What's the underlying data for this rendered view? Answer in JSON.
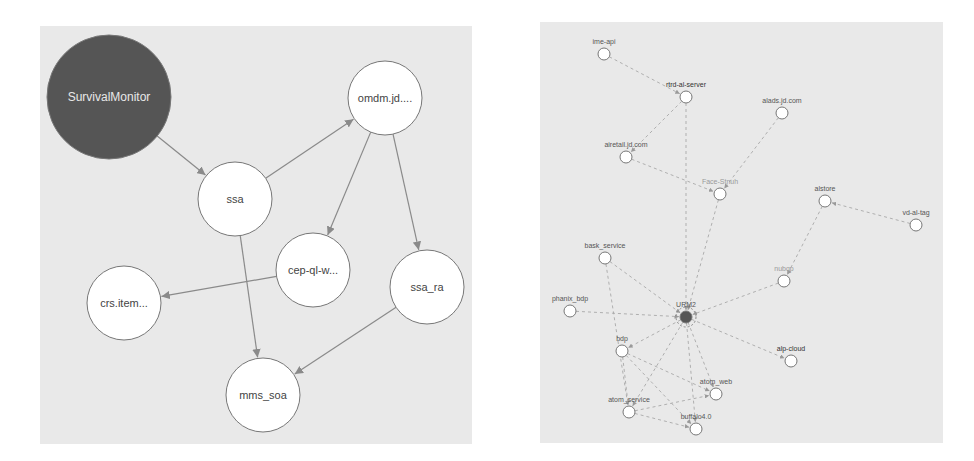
{
  "left_diagram": {
    "title": "",
    "background": "#e9e9e9",
    "edge_color": "#8a8a8a",
    "nodes": [
      {
        "id": "SurvivalMonitor",
        "label": "SurvivalMonitor",
        "x": 109,
        "y": 97,
        "r": 62,
        "fill": "#555555",
        "text_color": "#e8e8e8",
        "font_size": 12
      },
      {
        "id": "ssa",
        "label": "ssa",
        "x": 235,
        "y": 199,
        "r": 37,
        "fill": "#ffffff",
        "text_color": "#444444",
        "font_size": 11
      },
      {
        "id": "omdm",
        "label": "omdm.jd....",
        "x": 385,
        "y": 98,
        "r": 37,
        "fill": "#ffffff",
        "text_color": "#444444",
        "font_size": 11
      },
      {
        "id": "cep",
        "label": "cep-ql-w...",
        "x": 313,
        "y": 270,
        "r": 37,
        "fill": "#ffffff",
        "text_color": "#444444",
        "font_size": 11
      },
      {
        "id": "ssa_ra",
        "label": "ssa_ra",
        "x": 427,
        "y": 287,
        "r": 37,
        "fill": "#ffffff",
        "text_color": "#444444",
        "font_size": 11
      },
      {
        "id": "crs",
        "label": "crs.item...",
        "x": 124,
        "y": 303,
        "r": 37,
        "fill": "#ffffff",
        "text_color": "#444444",
        "font_size": 11
      },
      {
        "id": "mms_soa",
        "label": "mms_soa",
        "x": 263,
        "y": 395,
        "r": 37,
        "fill": "#ffffff",
        "text_color": "#444444",
        "font_size": 11
      }
    ],
    "edges": [
      {
        "from": "SurvivalMonitor",
        "to": "ssa"
      },
      {
        "from": "ssa",
        "to": "omdm"
      },
      {
        "from": "ssa",
        "to": "mms_soa"
      },
      {
        "from": "omdm",
        "to": "cep"
      },
      {
        "from": "omdm",
        "to": "ssa_ra"
      },
      {
        "from": "cep",
        "to": "crs"
      },
      {
        "from": "ssa_ra",
        "to": "mms_soa"
      }
    ]
  },
  "right_diagram": {
    "title": "",
    "background": "#e9e9e9",
    "edge_color": "#a8a8a8",
    "nodes": [
      {
        "id": "ime-api",
        "label": "ime-api",
        "x": 604,
        "y": 54,
        "r": 6,
        "fill": "#ffffff",
        "text_color": "#555555"
      },
      {
        "id": "rtrd-al-server",
        "label": "rtrd-al-server",
        "x": 686,
        "y": 97,
        "r": 6,
        "fill": "#ffffff",
        "text_color": "#333333"
      },
      {
        "id": "alads",
        "label": "alads.jd.com",
        "x": 782,
        "y": 113,
        "r": 6,
        "fill": "#ffffff",
        "text_color": "#555555"
      },
      {
        "id": "airetail",
        "label": "airetail.jd.com",
        "x": 626,
        "y": 157,
        "r": 6,
        "fill": "#ffffff",
        "text_color": "#555555"
      },
      {
        "id": "face",
        "label": "Face-Stnuh",
        "x": 720,
        "y": 194,
        "r": 6,
        "fill": "#ffffff",
        "text_color": "#999999"
      },
      {
        "id": "alstore",
        "label": "alstore",
        "x": 825,
        "y": 201,
        "r": 6,
        "fill": "#ffffff",
        "text_color": "#555555"
      },
      {
        "id": "vd-al-tag",
        "label": "vd-al-tag",
        "x": 916,
        "y": 225,
        "r": 6,
        "fill": "#ffffff",
        "text_color": "#555555"
      },
      {
        "id": "bask",
        "label": "bask_service",
        "x": 605,
        "y": 258,
        "r": 6,
        "fill": "#ffffff",
        "text_color": "#555555"
      },
      {
        "id": "nubqp",
        "label": "nubqp",
        "x": 784,
        "y": 281,
        "r": 6,
        "fill": "#ffffff",
        "text_color": "#999999"
      },
      {
        "id": "phanix",
        "label": "phanix_bdp",
        "x": 570,
        "y": 311,
        "r": 6,
        "fill": "#ffffff",
        "text_color": "#555555"
      },
      {
        "id": "URM2",
        "label": "URM2",
        "x": 686,
        "y": 317,
        "r": 6,
        "fill": "#555555",
        "text_color": "#555555"
      },
      {
        "id": "bdp",
        "label": "bdp",
        "x": 622,
        "y": 351,
        "r": 6,
        "fill": "#ffffff",
        "text_color": "#555555"
      },
      {
        "id": "alp-cloud",
        "label": "alp-cloud",
        "x": 791,
        "y": 361,
        "r": 6,
        "fill": "#ffffff",
        "text_color": "#333333"
      },
      {
        "id": "atom_web",
        "label": "atom_web",
        "x": 716,
        "y": 394,
        "r": 6,
        "fill": "#ffffff",
        "text_color": "#555555"
      },
      {
        "id": "atom_service",
        "label": "atom_service",
        "x": 629,
        "y": 412,
        "r": 6,
        "fill": "#ffffff",
        "text_color": "#555555"
      },
      {
        "id": "buffalo",
        "label": "buffalo4.0",
        "x": 696,
        "y": 429,
        "r": 6,
        "fill": "#ffffff",
        "text_color": "#555555"
      }
    ],
    "edges": [
      {
        "from": "ime-api",
        "to": "rtrd-al-server"
      },
      {
        "from": "rtrd-al-server",
        "to": "airetail"
      },
      {
        "from": "rtrd-al-server",
        "to": "URM2"
      },
      {
        "from": "alads",
        "to": "face"
      },
      {
        "from": "airetail",
        "to": "face"
      },
      {
        "from": "face",
        "to": "URM2"
      },
      {
        "from": "vd-al-tag",
        "to": "alstore"
      },
      {
        "from": "alstore",
        "to": "nubqp"
      },
      {
        "from": "nubqp",
        "to": "URM2"
      },
      {
        "from": "bask",
        "to": "URM2"
      },
      {
        "from": "bask",
        "to": "atom_service"
      },
      {
        "from": "phanix",
        "to": "URM2"
      },
      {
        "from": "URM2",
        "to": "bdp"
      },
      {
        "from": "URM2",
        "to": "alp-cloud"
      },
      {
        "from": "URM2",
        "to": "atom_web"
      },
      {
        "from": "URM2",
        "to": "atom_service"
      },
      {
        "from": "URM2",
        "to": "buffalo"
      },
      {
        "from": "bdp",
        "to": "atom_service"
      },
      {
        "from": "bdp",
        "to": "atom_web"
      },
      {
        "from": "bdp",
        "to": "buffalo"
      },
      {
        "from": "atom_service",
        "to": "buffalo"
      },
      {
        "from": "atom_service",
        "to": "atom_web"
      }
    ]
  }
}
